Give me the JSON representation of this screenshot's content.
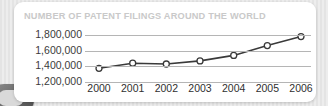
{
  "chart_data": {
    "type": "line",
    "title": "NUMBER OF PATENT FILINGS AROUND THE WORLD",
    "xlabel": "",
    "ylabel": "",
    "categories": [
      "2000",
      "2001",
      "2002",
      "2003",
      "2004",
      "2005",
      "2006"
    ],
    "values": [
      1375000,
      1440000,
      1430000,
      1470000,
      1540000,
      1665000,
      1780000
    ],
    "ylim": [
      1200000,
      1800000
    ],
    "yticks": [
      1200000,
      1400000,
      1600000,
      1800000
    ],
    "ytick_labels": [
      "1,200,000",
      "1,400,000",
      "1,600,000",
      "1,800,000"
    ],
    "grid": true,
    "legend": false,
    "series": [
      {
        "name": "Patent filings",
        "values": [
          1375000,
          1440000,
          1430000,
          1470000,
          1540000,
          1665000,
          1780000
        ]
      }
    ],
    "colors": {
      "line": "#3a3a3a",
      "marker_fill": "#ffffff",
      "marker_stroke": "#3a3a3a",
      "grid": "#b5b5b5",
      "title": "#c9c9c9",
      "tick_text": "#333333",
      "card_background": "#ffffff",
      "page_background": "#e7e7e7"
    }
  }
}
